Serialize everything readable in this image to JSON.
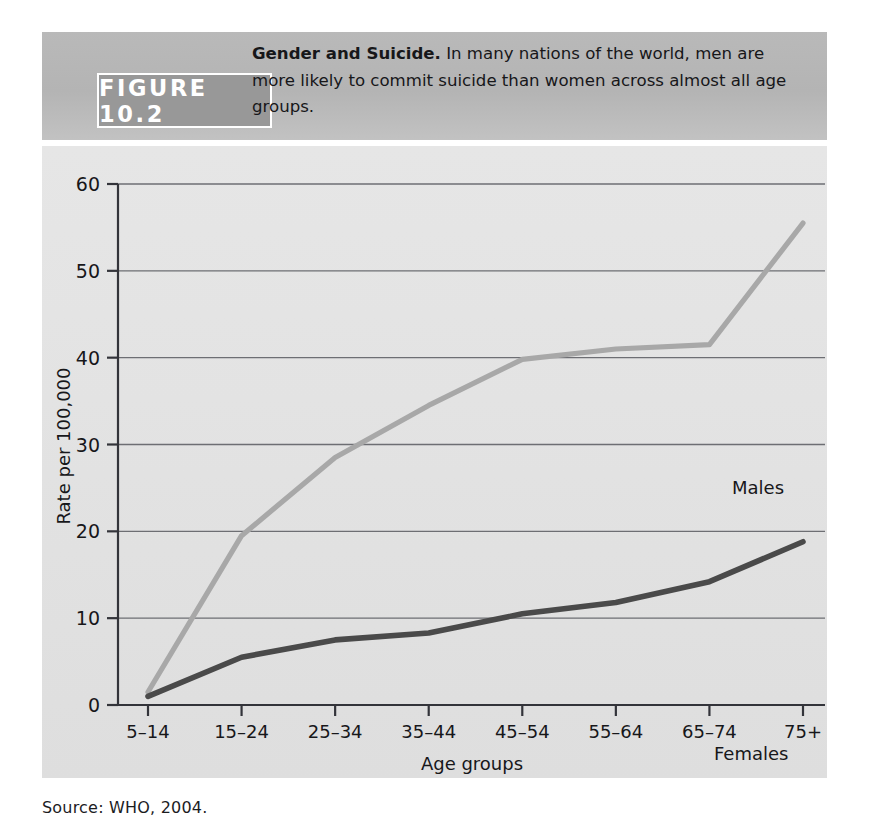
{
  "figure": {
    "tag": "FIGURE 10.2",
    "caption_bold": "Gender and Suicide.",
    "caption_rest": " In many nations of the world, men are more likely to commit suicide than women across almost all age groups.",
    "source": "Source: WHO, 2004."
  },
  "chart_data": {
    "type": "line",
    "title": "",
    "xlabel": "Age groups",
    "ylabel": "Rate per 100,000",
    "categories": [
      "5–14",
      "15–24",
      "25–34",
      "35–44",
      "45–54",
      "55–64",
      "65–74",
      "75+"
    ],
    "ylim": [
      0,
      60
    ],
    "yticks": [
      0,
      10,
      20,
      30,
      40,
      50,
      60
    ],
    "ytick_labels": [
      "0",
      "10",
      "20",
      "30",
      "40",
      "50",
      "60"
    ],
    "grid": "horizontal",
    "legend_position": "inline-labels",
    "series": [
      {
        "name": "Males",
        "color": "#a8a8a8",
        "values": [
          1.5,
          19.5,
          28.5,
          34.5,
          39.8,
          41.0,
          41.5,
          55.5
        ]
      },
      {
        "name": "Females",
        "color": "#4a4a4a",
        "values": [
          1.0,
          5.5,
          7.5,
          8.3,
          10.5,
          11.8,
          14.2,
          18.8
        ]
      }
    ]
  },
  "colors": {
    "males_line": "#a8a8a8",
    "females_line": "#4a4a4a",
    "axis": "#33343a",
    "grid": "#6d6e73",
    "panel_bg": "#e3e3e3",
    "header_band": "#b6b6b6",
    "tag_bg": "#989898"
  }
}
